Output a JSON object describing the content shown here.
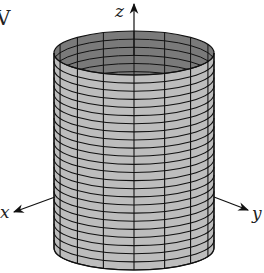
{
  "figure": {
    "corner_label": "V",
    "axes": {
      "x_label": "x",
      "y_label": "y",
      "z_label": "z"
    },
    "surface": {
      "shape": "cylinder",
      "outer_color": "#bdbdbd",
      "inner_color": "#7a7a7a",
      "grid_color": "#111111",
      "segments": 16,
      "rings": 24
    }
  }
}
